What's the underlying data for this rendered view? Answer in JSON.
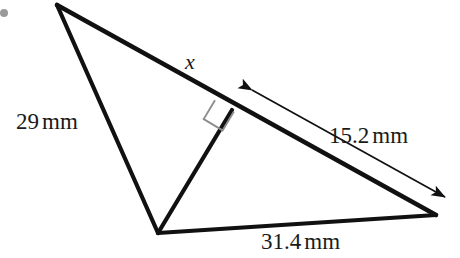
{
  "figure": {
    "type": "geometry-diagram",
    "shape": "triangle-with-altitude",
    "background_color": "#ffffff",
    "stroke_color": "#111111",
    "marker_color": "#8a8a8a"
  },
  "labels": {
    "side_left": {
      "value": "29",
      "unit": "mm",
      "text": "29 mm"
    },
    "side_bottom": {
      "value": "31.4",
      "unit": "mm",
      "text": "31.4 mm"
    },
    "arrow_measure": {
      "value": "15.2",
      "unit": "mm",
      "text": "15.2 mm"
    },
    "unknown": {
      "text": "x"
    }
  },
  "geometry": {
    "vertices": {
      "apex": {
        "x": 57,
        "y": 5
      },
      "bottom": {
        "x": 158,
        "y": 233
      },
      "right": {
        "x": 436,
        "y": 215
      }
    },
    "altitude_foot": {
      "x": 232,
      "y": 110
    },
    "measure_arrow": {
      "from": {
        "x": 252,
        "y": 90
      },
      "to": {
        "x": 445,
        "y": 197
      },
      "double_headed": true
    },
    "right_angle_marker": {
      "size": 20,
      "at": {
        "x": 232,
        "y": 110
      }
    },
    "corner_dot": {
      "x": 4,
      "y": 13,
      "radius": 4
    }
  }
}
